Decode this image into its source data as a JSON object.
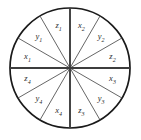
{
  "figure": {
    "type": "sector-circle-diagram",
    "geometry": {
      "center_x": 70,
      "center_y": 68,
      "radius": 60,
      "sector_count": 12,
      "sector_angle_degrees": 30,
      "label_radius": 44
    },
    "colors": {
      "background": "#ffffff",
      "circle_outline": "#1a1a1a",
      "axis_spoke": "#3d3d3d",
      "minor_spoke": "#4a4a4a",
      "label_text": "#2b2b2b"
    },
    "axes": [
      {
        "name": "horizontal-axis",
        "angle_degrees": 0
      },
      {
        "name": "vertical-axis",
        "angle_degrees": 90
      }
    ],
    "minor_spoke_angles_degrees": [
      30,
      60,
      120,
      150,
      210,
      240,
      300,
      330
    ],
    "sectors": [
      {
        "id": "s1",
        "base": "x",
        "sub": "2",
        "start_deg": 60,
        "end_deg": 90,
        "mid_deg": 75,
        "quadrant": "upper-right"
      },
      {
        "id": "s2",
        "base": "y",
        "sub": "2",
        "start_deg": 30,
        "end_deg": 60,
        "mid_deg": 45,
        "quadrant": "upper-right"
      },
      {
        "id": "s3",
        "base": "z",
        "sub": "2",
        "start_deg": 0,
        "end_deg": 30,
        "mid_deg": 15,
        "quadrant": "upper-right"
      },
      {
        "id": "s4",
        "base": "x",
        "sub": "3",
        "start_deg": 330,
        "end_deg": 360,
        "mid_deg": 345,
        "quadrant": "lower-right"
      },
      {
        "id": "s5",
        "base": "y",
        "sub": "3",
        "start_deg": 300,
        "end_deg": 330,
        "mid_deg": 315,
        "quadrant": "lower-right"
      },
      {
        "id": "s6",
        "base": "z",
        "sub": "3",
        "start_deg": 270,
        "end_deg": 300,
        "mid_deg": 285,
        "quadrant": "lower-right"
      },
      {
        "id": "s7",
        "base": "x",
        "sub": "4",
        "start_deg": 240,
        "end_deg": 270,
        "mid_deg": 255,
        "quadrant": "lower-left"
      },
      {
        "id": "s8",
        "base": "y",
        "sub": "4",
        "start_deg": 210,
        "end_deg": 240,
        "mid_deg": 225,
        "quadrant": "lower-left"
      },
      {
        "id": "s9",
        "base": "z",
        "sub": "4",
        "start_deg": 180,
        "end_deg": 210,
        "mid_deg": 195,
        "quadrant": "lower-left"
      },
      {
        "id": "s10",
        "base": "x",
        "sub": "1",
        "start_deg": 150,
        "end_deg": 180,
        "mid_deg": 165,
        "quadrant": "upper-left"
      },
      {
        "id": "s11",
        "base": "y",
        "sub": "1",
        "start_deg": 120,
        "end_deg": 150,
        "mid_deg": 135,
        "quadrant": "upper-left"
      },
      {
        "id": "s12",
        "base": "z",
        "sub": "1",
        "start_deg": 90,
        "end_deg": 120,
        "mid_deg": 105,
        "quadrant": "upper-left"
      }
    ]
  }
}
